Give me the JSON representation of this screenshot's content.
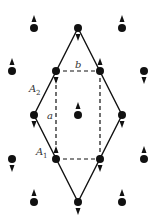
{
  "diagram": {
    "colors": {
      "ink": "#111111",
      "label": "#333333",
      "background": "#ffffff"
    },
    "labels": {
      "a": "a",
      "b": "b",
      "A1_main": "A",
      "A1_sub": "1",
      "A2_main": "A",
      "A2_sub": "2"
    },
    "rhombus": {
      "vertices": [
        [
          78,
          28
        ],
        [
          122,
          115
        ],
        [
          78,
          202
        ],
        [
          34,
          115
        ]
      ],
      "style": "solid"
    },
    "rectangle": {
      "corners": [
        [
          56,
          71
        ],
        [
          100,
          71
        ],
        [
          100,
          159
        ],
        [
          56,
          159
        ]
      ],
      "style": "dashed"
    },
    "sites": [
      {
        "x": 34,
        "y": 28,
        "spin": "up"
      },
      {
        "x": 78,
        "y": 28,
        "spin": "down"
      },
      {
        "x": 122,
        "y": 28,
        "spin": "up"
      },
      {
        "x": 12,
        "y": 71,
        "spin": "up"
      },
      {
        "x": 56,
        "y": 71,
        "spin": "down"
      },
      {
        "x": 100,
        "y": 71,
        "spin": "up"
      },
      {
        "x": 144,
        "y": 71,
        "spin": "down"
      },
      {
        "x": 34,
        "y": 115,
        "spin": "down"
      },
      {
        "x": 78,
        "y": 115,
        "spin": "up"
      },
      {
        "x": 122,
        "y": 115,
        "spin": "down"
      },
      {
        "x": 12,
        "y": 159,
        "spin": "down"
      },
      {
        "x": 56,
        "y": 159,
        "spin": "up"
      },
      {
        "x": 100,
        "y": 159,
        "spin": "down"
      },
      {
        "x": 144,
        "y": 159,
        "spin": "up"
      },
      {
        "x": 34,
        "y": 202,
        "spin": "up"
      },
      {
        "x": 78,
        "y": 202,
        "spin": "down"
      },
      {
        "x": 122,
        "y": 202,
        "spin": "up"
      }
    ]
  }
}
